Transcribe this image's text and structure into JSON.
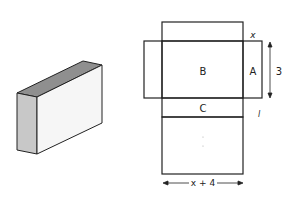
{
  "figure": {
    "colors": {
      "outline": "#222222",
      "front_face": "#f4f4f4",
      "side_face": "#c8c8c8",
      "top_face": "#8f8f8f",
      "background": "#ffffff"
    },
    "net": {
      "face_labels": {
        "b": "B",
        "a": "A",
        "c": "C"
      },
      "dimension_labels": {
        "top_right": "x",
        "height": "3",
        "lower_right": "l",
        "width": "x + 4"
      }
    }
  }
}
